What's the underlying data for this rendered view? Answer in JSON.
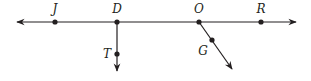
{
  "diagram": {
    "type": "geometry-lines-rays",
    "stroke_color": "#231f20",
    "main_line": {
      "name": "line JR",
      "y": 22,
      "x_start": 17,
      "x_end": 296,
      "arrows": "both"
    },
    "points": [
      {
        "label": "J",
        "x": 55,
        "y": 22,
        "label_x": 55,
        "label_y": 13
      },
      {
        "label": "D",
        "x": 117,
        "y": 22,
        "label_x": 117,
        "label_y": 13
      },
      {
        "label": "O",
        "x": 199,
        "y": 22,
        "label_x": 199,
        "label_y": 13
      },
      {
        "label": "R",
        "x": 261,
        "y": 22,
        "label_x": 261,
        "label_y": 13
      },
      {
        "label": "T",
        "x": 117,
        "y": 54,
        "label_x": 107,
        "label_y": 58
      },
      {
        "label": "G",
        "x": 212,
        "y": 40,
        "label_x": 203,
        "label_y": 55
      }
    ],
    "rays": [
      {
        "name": "ray DT",
        "from": "D",
        "x1": 117,
        "y1": 22,
        "x2": 117,
        "y2": 71
      },
      {
        "name": "ray OG",
        "from": "O",
        "x1": 199,
        "y1": 22,
        "x2": 232,
        "y2": 69
      }
    ]
  }
}
